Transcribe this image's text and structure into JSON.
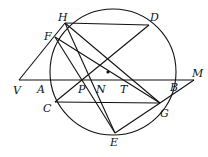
{
  "diagram": {
    "type": "circle-geometry",
    "circle": {
      "cx": 113,
      "cy": 72,
      "r": 63
    },
    "center_dot": {
      "x": 108,
      "y": 72
    },
    "points": {
      "H": {
        "x": 65,
        "y": 23,
        "lx": 58,
        "ly": 21
      },
      "D": {
        "x": 149,
        "y": 25,
        "lx": 150,
        "ly": 21
      },
      "F": {
        "x": 55,
        "y": 37,
        "lx": 44,
        "ly": 40
      },
      "V": {
        "x": 19,
        "y": 80,
        "lx": 13,
        "ly": 94
      },
      "A": {
        "x": 47,
        "y": 80,
        "lx": 37,
        "ly": 93
      },
      "P": {
        "x": 84,
        "y": 80,
        "lx": 78,
        "ly": 93
      },
      "N": {
        "x": 98,
        "y": 80,
        "lx": 96,
        "ly": 93
      },
      "T": {
        "x": 127,
        "y": 80,
        "lx": 120,
        "ly": 93
      },
      "B": {
        "x": 176,
        "y": 80,
        "lx": 170,
        "ly": 91
      },
      "M": {
        "x": 194,
        "y": 80,
        "lx": 192,
        "ly": 77
      },
      "C": {
        "x": 55,
        "y": 102,
        "lx": 43,
        "ly": 112
      },
      "G": {
        "x": 160,
        "y": 103,
        "lx": 160,
        "ly": 117
      },
      "E": {
        "x": 115,
        "y": 133,
        "lx": 110,
        "ly": 146
      }
    },
    "segments": [
      [
        "H",
        "D"
      ],
      [
        "V",
        "M"
      ],
      [
        "C",
        "G"
      ],
      [
        "V",
        "H"
      ],
      [
        "F",
        "G"
      ],
      [
        "F",
        "E"
      ],
      [
        "H",
        "E"
      ],
      [
        "D",
        "C"
      ],
      [
        "E",
        "G"
      ],
      [
        "G",
        "M"
      ],
      [
        "H",
        "G"
      ]
    ],
    "labels": [
      "H",
      "D",
      "F",
      "V",
      "A",
      "P",
      "N",
      "T",
      "B",
      "M",
      "C",
      "G",
      "E"
    ]
  }
}
